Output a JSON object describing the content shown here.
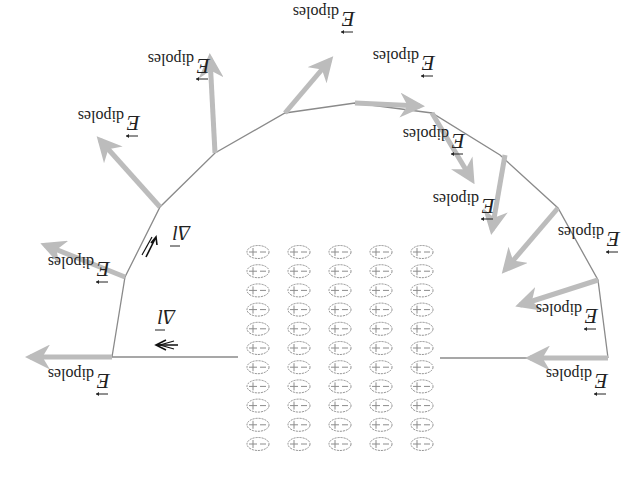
{
  "figure": {
    "orientation": "rotated-180",
    "field_label": {
      "symbol": "E",
      "subscript": "dipoles"
    },
    "dl_label": {
      "symbol": "Δl"
    },
    "colors": {
      "arrow": "#bcbcbc",
      "path": "#8a8a8a",
      "text": "#222222",
      "dipole": "#8c8c8c"
    },
    "path_vertices": [
      [
        112,
        357
      ],
      [
        125,
        277
      ],
      [
        160,
        207
      ],
      [
        215,
        153
      ],
      [
        285,
        113
      ],
      [
        355,
        103
      ],
      [
        432,
        113
      ],
      [
        500,
        155
      ],
      [
        558,
        208
      ],
      [
        598,
        280
      ],
      [
        608,
        358
      ]
    ],
    "left_segment": [
      [
        112,
        357
      ],
      [
        238,
        357
      ]
    ],
    "right_segment": [
      [
        440,
        358
      ],
      [
        608,
        358
      ]
    ],
    "field_arrows": [
      {
        "from": [
          112,
          357
        ],
        "to": [
          30,
          357
        ],
        "label": "E dipoles",
        "label_pos": [
          30,
          390
        ]
      },
      {
        "from": [
          125,
          277
        ],
        "to": [
          45,
          245
        ],
        "label": "E dipoles",
        "label_pos": [
          30,
          278
        ]
      },
      {
        "from": [
          160,
          207
        ],
        "to": [
          100,
          140
        ],
        "label": "E dipoles",
        "label_pos": [
          60,
          132
        ]
      },
      {
        "from": [
          215,
          153
        ],
        "to": [
          210,
          58
        ],
        "label": "E dipoles",
        "label_pos": [
          130,
          75
        ]
      },
      {
        "from": [
          285,
          113
        ],
        "to": [
          330,
          60
        ],
        "label": "E dipoles",
        "label_pos": [
          275,
          28
        ]
      },
      {
        "from": [
          355,
          103
        ],
        "to": [
          420,
          106
        ],
        "label": "E dipoles",
        "label_pos": [
          355,
          72
        ]
      },
      {
        "from": [
          432,
          113
        ],
        "to": [
          472,
          180
        ],
        "label": "E dipoles",
        "label_pos": [
          385,
          150
        ]
      },
      {
        "from": [
          505,
          155
        ],
        "to": [
          492,
          230
        ],
        "label": "E dipoles",
        "label_pos": [
          415,
          215
        ]
      },
      {
        "from": [
          558,
          208
        ],
        "to": [
          505,
          270
        ],
        "label": "E dipoles",
        "label_pos": [
          540,
          248
        ]
      },
      {
        "from": [
          598,
          280
        ],
        "to": [
          520,
          305
        ],
        "label": "E dipoles",
        "label_pos": [
          518,
          325
        ]
      },
      {
        "from": [
          608,
          358
        ],
        "to": [
          530,
          358
        ],
        "label": "E dipoles",
        "label_pos": [
          528,
          390
        ]
      }
    ],
    "dl_markers": [
      {
        "pos": [
          160,
          345
        ],
        "label": "Δl",
        "label_pos": [
          155,
          322
        ],
        "dir": "left"
      },
      {
        "pos": [
          150,
          245
        ],
        "label": "Δl",
        "label_pos": [
          170,
          238
        ],
        "dir": "up"
      }
    ],
    "dipole_grid": {
      "rows": 11,
      "cols": 5,
      "x0": 258,
      "y0": 252,
      "dx": 41,
      "dy": 19.2,
      "plus": "+",
      "minus": "−"
    }
  }
}
